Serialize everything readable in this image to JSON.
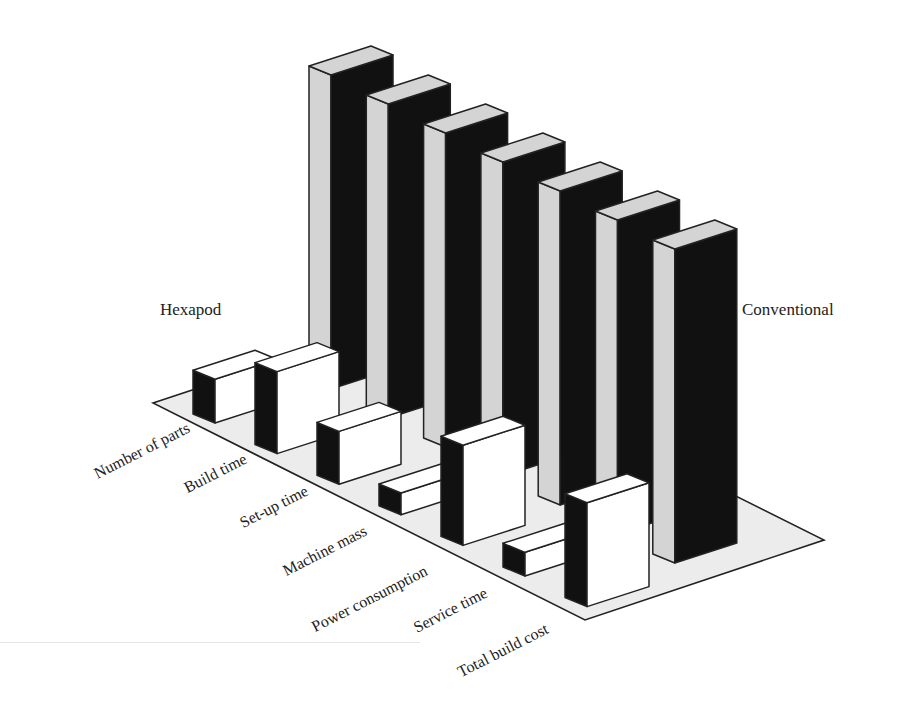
{
  "chart_data": {
    "type": "bar",
    "subtype": "3d-grouped-bar",
    "title": "",
    "xlabel": "",
    "ylabel": "",
    "grid": false,
    "axis_ticks": false,
    "categories": [
      "Number of parts",
      "Build time",
      "Set-up time",
      "Machine mass",
      "Power consumption",
      "Service time",
      "Total build cost"
    ],
    "series": [
      {
        "name": "Hexapod",
        "values": [
          24,
          45,
          29,
          12,
          55,
          13,
          57
        ]
      },
      {
        "name": "Conventional",
        "values": [
          100,
          100,
          100,
          100,
          100,
          100,
          100
        ]
      }
    ],
    "value_scale": "relative (conventional = 100, no numeric axis shown)",
    "legend": {
      "position": "inline labels",
      "entries": [
        "Hexapod",
        "Conventional"
      ]
    },
    "colors": {
      "hexapod_front": "#ffffff",
      "hexapod_side": "#111111",
      "hexapod_top": "#ffffff",
      "conventional_front": "#111111",
      "conventional_side": "#d4d4d4",
      "conventional_top": "#d4d4d4",
      "floor": "#ececec",
      "outline": "#222222"
    }
  },
  "labels": {
    "hexapod": "Hexapod",
    "conventional": "Conventional",
    "categories": [
      "Number of parts",
      "Build time",
      "Set-up time",
      "Machine mass",
      "Power consumption",
      "Service time",
      "Total build cost"
    ]
  }
}
